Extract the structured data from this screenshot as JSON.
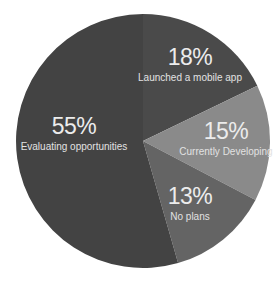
{
  "chart_data": {
    "type": "pie",
    "title": "",
    "start_angle_deg": 0,
    "direction": "clockwise",
    "center": [
      143,
      141
    ],
    "radius": 127,
    "categories": [
      "Launched a mobile app",
      "Currently Developing",
      "No plans",
      "Evaluating opportunities"
    ],
    "values": [
      18,
      15,
      13,
      55
    ],
    "labels": [
      "18%",
      "15%",
      "13%",
      "55%"
    ],
    "colors": [
      "#4a4a4a",
      "#8a8a8a",
      "#646464",
      "#434343"
    ],
    "label_positions": [
      [
        190,
        46
      ],
      [
        226,
        120
      ],
      [
        190,
        185
      ],
      [
        74,
        115
      ]
    ],
    "legend": "none (inline data labels)"
  },
  "slices": [
    {
      "pct": "18%",
      "name": "Launched a mobile app"
    },
    {
      "pct": "15%",
      "name": "Currently Developing"
    },
    {
      "pct": "13%",
      "name": "No plans"
    },
    {
      "pct": "55%",
      "name": "Evaluating opportunities"
    }
  ]
}
